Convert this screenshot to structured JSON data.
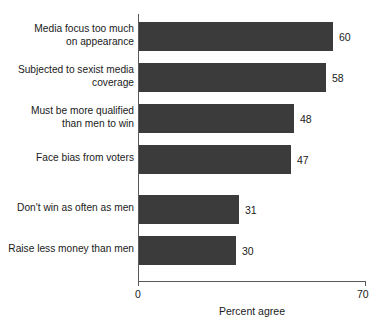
{
  "chart_data": {
    "type": "bar",
    "orientation": "horizontal",
    "title": "",
    "subtitle": "",
    "xlabel": "Percent agree",
    "ylabel": "",
    "xlim": [
      0,
      70
    ],
    "xticks": [
      0,
      70
    ],
    "xtick_labels": [
      "0",
      "70"
    ],
    "grid": false,
    "legend": null,
    "bar_color": "#3b3b3b",
    "axis_color": "#58595b",
    "background": "#ffffff",
    "categories": [
      "Media focus too much\non appearance",
      "Subjected to sexist media\ncoverage",
      "Must be more qualified\nthan men to win",
      "Face bias from voters",
      "Don't win as often as men",
      "Raise less money than men"
    ],
    "values": [
      60,
      58,
      48,
      47,
      31,
      30
    ],
    "value_labels": [
      "60",
      "58",
      "48",
      "47",
      "31",
      "30"
    ],
    "group_break_after_index": 3
  },
  "axis": {
    "x_min_label": "0",
    "x_max_label": "70",
    "x_title": "Percent agree"
  }
}
